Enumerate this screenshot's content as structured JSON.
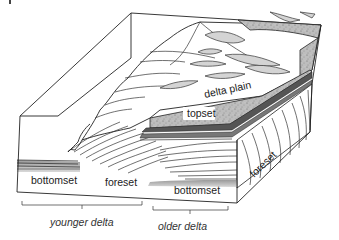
{
  "diagram": {
    "type": "geological block diagram",
    "labels": {
      "delta_plain": "delta plain",
      "topset": "topset",
      "bottomset_left": "bottomset",
      "foreset_left": "foreset",
      "bottomset_right": "bottomset",
      "foreset_right": "foreset"
    },
    "brackets": {
      "younger": "younger delta",
      "older": "older delta"
    },
    "colors": {
      "outline": "#222222",
      "channel_fill": "#d4d4d4",
      "topset_fill": "#b8b8b8",
      "bedding_dark": "#555555",
      "background": "#ffffff"
    }
  }
}
